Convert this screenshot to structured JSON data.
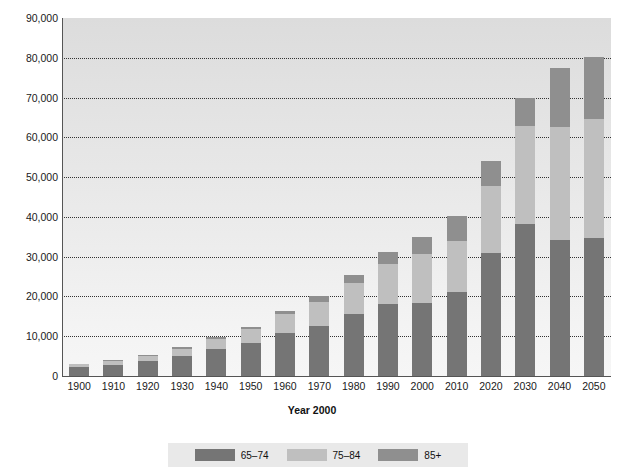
{
  "chart_data": {
    "type": "bar",
    "stacked": true,
    "title": "",
    "xlabel": "Year 2000",
    "ylabel": "",
    "ylim": [
      0,
      90000
    ],
    "ytick_values": [
      0,
      10000,
      20000,
      30000,
      40000,
      50000,
      60000,
      70000,
      80000,
      90000
    ],
    "ytick_labels": [
      "0",
      "10,000",
      "20,000",
      "30,000",
      "40,000",
      "50,000",
      "60,000",
      "70,000",
      "80,000",
      "90,000"
    ],
    "grid": true,
    "grid_style": "dotted-horizontal",
    "legend_position": "bottom",
    "categories": [
      "1900",
      "1910",
      "1920",
      "1930",
      "1940",
      "1950",
      "1960",
      "1970",
      "1980",
      "1990",
      "2000",
      "2010",
      "2020",
      "2030",
      "2040",
      "2050"
    ],
    "series": [
      {
        "name": "65–74",
        "color": "#757575",
        "values": [
          2200,
          2800,
          3700,
          5000,
          6900,
          8400,
          10900,
          12500,
          15600,
          18100,
          18400,
          21100,
          31000,
          38200,
          34100,
          34700
        ]
      },
      {
        "name": "75–84",
        "color": "#bfbfbf",
        "values": [
          800,
          1000,
          1300,
          1800,
          2400,
          3300,
          4600,
          6100,
          7700,
          10100,
          12400,
          12800,
          16700,
          24600,
          28400,
          30000
        ]
      },
      {
        "name": "85+",
        "color": "#8f8f8f",
        "values": [
          100,
          200,
          300,
          400,
          500,
          600,
          900,
          1400,
          2200,
          3000,
          4200,
          6400,
          6300,
          7200,
          14900,
          15400
        ]
      }
    ],
    "totals": [
      3100,
      4000,
      5300,
      7200,
      9800,
      12300,
      16400,
      20000,
      25500,
      31200,
      35000,
      40300,
      54000,
      70000,
      77400,
      80100
    ]
  },
  "legend": {
    "items": [
      {
        "label": "65–74",
        "color": "#757575"
      },
      {
        "label": "75–84",
        "color": "#bfbfbf"
      },
      {
        "label": "85+",
        "color": "#8f8f8f"
      }
    ]
  },
  "axis": {
    "x_title": "Year 2000"
  }
}
